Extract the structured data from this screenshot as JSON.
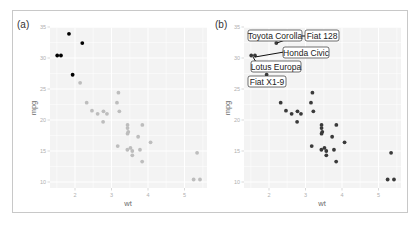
{
  "chart_data": [
    {
      "panel": "(a)",
      "type": "scatter",
      "title": "",
      "xlabel": "wt",
      "ylabel": "mpg",
      "xlim": [
        1.317,
        5.62
      ],
      "ylim": [
        9.225,
        35.075
      ],
      "x_ticks": [
        2,
        3,
        4,
        5
      ],
      "y_ticks": [
        10,
        15,
        20,
        25,
        30,
        35
      ],
      "grid": true,
      "series": [
        {
          "name": "highlighted (mpg > 27)",
          "color": "#000000",
          "points": [
            {
              "x": 2.2,
              "y": 32.4
            },
            {
              "x": 1.615,
              "y": 30.4
            },
            {
              "x": 1.835,
              "y": 33.9
            },
            {
              "x": 1.935,
              "y": 27.3
            },
            {
              "x": 1.513,
              "y": 30.4
            }
          ]
        },
        {
          "name": "other",
          "color": "#bdbdbd",
          "points": [
            {
              "x": 2.62,
              "y": 21.0
            },
            {
              "x": 2.875,
              "y": 21.0
            },
            {
              "x": 2.32,
              "y": 22.8
            },
            {
              "x": 3.215,
              "y": 21.4
            },
            {
              "x": 3.44,
              "y": 18.7
            },
            {
              "x": 3.46,
              "y": 18.1
            },
            {
              "x": 3.57,
              "y": 14.3
            },
            {
              "x": 3.19,
              "y": 24.4
            },
            {
              "x": 3.15,
              "y": 22.8
            },
            {
              "x": 3.44,
              "y": 19.2
            },
            {
              "x": 3.44,
              "y": 17.8
            },
            {
              "x": 4.07,
              "y": 16.4
            },
            {
              "x": 3.73,
              "y": 17.3
            },
            {
              "x": 3.78,
              "y": 15.2
            },
            {
              "x": 5.25,
              "y": 10.4
            },
            {
              "x": 5.424,
              "y": 10.4
            },
            {
              "x": 5.345,
              "y": 14.7
            },
            {
              "x": 2.465,
              "y": 21.5
            },
            {
              "x": 3.52,
              "y": 15.5
            },
            {
              "x": 3.435,
              "y": 15.2
            },
            {
              "x": 3.84,
              "y": 13.3
            },
            {
              "x": 3.845,
              "y": 19.2
            },
            {
              "x": 2.14,
              "y": 26.0
            },
            {
              "x": 3.17,
              "y": 15.8
            },
            {
              "x": 2.77,
              "y": 19.7
            },
            {
              "x": 3.57,
              "y": 15.0
            },
            {
              "x": 2.78,
              "y": 21.4
            }
          ]
        }
      ]
    },
    {
      "panel": "(b)",
      "type": "scatter",
      "title": "",
      "xlabel": "wt",
      "ylabel": "mpg",
      "xlim": [
        1.317,
        5.62
      ],
      "ylim": [
        9.225,
        35.075
      ],
      "x_ticks": [
        2,
        3,
        4,
        5
      ],
      "y_ticks": [
        10,
        15,
        20,
        25,
        30,
        35
      ],
      "grid": true,
      "series": [
        {
          "name": "all cars",
          "color": "#3a3a3a",
          "points": [
            {
              "x": 2.62,
              "y": 21.0
            },
            {
              "x": 2.875,
              "y": 21.0
            },
            {
              "x": 2.32,
              "y": 22.8
            },
            {
              "x": 3.215,
              "y": 21.4
            },
            {
              "x": 3.44,
              "y": 18.7
            },
            {
              "x": 3.46,
              "y": 18.1
            },
            {
              "x": 3.57,
              "y": 14.3
            },
            {
              "x": 3.19,
              "y": 24.4
            },
            {
              "x": 3.15,
              "y": 22.8
            },
            {
              "x": 3.44,
              "y": 19.2
            },
            {
              "x": 3.44,
              "y": 17.8
            },
            {
              "x": 4.07,
              "y": 16.4
            },
            {
              "x": 3.73,
              "y": 17.3
            },
            {
              "x": 3.78,
              "y": 15.2
            },
            {
              "x": 5.25,
              "y": 10.4
            },
            {
              "x": 5.424,
              "y": 10.4
            },
            {
              "x": 5.345,
              "y": 14.7
            },
            {
              "x": 2.2,
              "y": 32.4
            },
            {
              "x": 1.615,
              "y": 30.4
            },
            {
              "x": 1.835,
              "y": 33.9
            },
            {
              "x": 2.465,
              "y": 21.5
            },
            {
              "x": 3.52,
              "y": 15.5
            },
            {
              "x": 3.435,
              "y": 15.2
            },
            {
              "x": 3.84,
              "y": 13.3
            },
            {
              "x": 3.845,
              "y": 19.2
            },
            {
              "x": 1.935,
              "y": 27.3
            },
            {
              "x": 2.14,
              "y": 26.0
            },
            {
              "x": 1.513,
              "y": 30.4
            },
            {
              "x": 3.17,
              "y": 15.8
            },
            {
              "x": 2.77,
              "y": 19.7
            },
            {
              "x": 3.57,
              "y": 15.0
            },
            {
              "x": 2.78,
              "y": 21.4
            }
          ]
        }
      ],
      "annotations": [
        {
          "text": "Toyota Corolla",
          "x": 1.835,
          "y": 33.9
        },
        {
          "text": "Fiat 128",
          "x": 2.2,
          "y": 32.4
        },
        {
          "text": "Honda Civic",
          "x": 1.615,
          "y": 30.4
        },
        {
          "text": "Lotus Europa",
          "x": 1.513,
          "y": 30.4
        },
        {
          "text": "Fiat X1-9",
          "x": 1.935,
          "y": 27.3
        }
      ]
    }
  ],
  "panels": {
    "a": {
      "tag": "(a)",
      "xlabel": "wt",
      "ylabel": "mpg"
    },
    "b": {
      "tag": "(b)",
      "xlabel": "wt",
      "ylabel": "mpg"
    }
  },
  "ticks": {
    "x": [
      "2",
      "3",
      "4",
      "5"
    ],
    "y": [
      "35",
      "30",
      "25",
      "20",
      "15",
      "10"
    ]
  },
  "labels": {
    "toyota": "Toyota Corolla",
    "fiat128": "Fiat 128",
    "honda": "Honda Civic",
    "lotus": "Lotus Europa",
    "fiatx19": "Fiat X1-9"
  },
  "colors": {
    "panel_bg": "#ebebeb",
    "grid": "#ffffff",
    "highlight": "#000000",
    "faded_point": "#bdbdbd",
    "normal_point": "#3a3a3a"
  }
}
